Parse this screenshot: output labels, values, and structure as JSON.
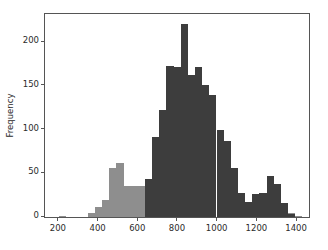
{
  "chart_data": {
    "type": "bar",
    "title": "",
    "xlabel": "",
    "ylabel": "Frequency",
    "xlim": [
      130,
      1460
    ],
    "ylim": [
      0,
      232
    ],
    "grid": false,
    "legend": null,
    "bin_width": 36,
    "xticks": [
      200,
      400,
      600,
      800,
      1000,
      1200,
      1400
    ],
    "xticklabels": [
      "200",
      "400",
      "600",
      "800",
      "1000",
      "1200",
      "1400"
    ],
    "yticks": [
      0,
      50,
      100,
      150,
      200
    ],
    "yticklabels": [
      "0",
      "50",
      "100",
      "150",
      "200"
    ],
    "series": [
      {
        "name": "light",
        "color": "#8e8e8e",
        "bin_starts": [
          202,
          238,
          274,
          310,
          346,
          382,
          418,
          454,
          490,
          526,
          562,
          598,
          634,
          670,
          706,
          742,
          778,
          814,
          850,
          886,
          922,
          958,
          994,
          1030,
          1066,
          1102,
          1138,
          1174,
          1210,
          1246,
          1282,
          1318,
          1354,
          1390
        ],
        "values": [
          1,
          0,
          0,
          0,
          5,
          11,
          19,
          56,
          62,
          35,
          35,
          35,
          22,
          47,
          49,
          57,
          66,
          80,
          65,
          54,
          39,
          34,
          26,
          15,
          11,
          7,
          10,
          11,
          14,
          22,
          21,
          10,
          5,
          1
        ]
      },
      {
        "name": "dark",
        "color": "#3d3d3d",
        "bin_starts": [
          202,
          238,
          274,
          310,
          346,
          382,
          418,
          454,
          490,
          526,
          562,
          598,
          634,
          670,
          706,
          742,
          778,
          814,
          850,
          886,
          922,
          958,
          994,
          1030,
          1066,
          1102,
          1138,
          1174,
          1210,
          1246,
          1282,
          1318,
          1354,
          1390
        ],
        "values": [
          0,
          0,
          0,
          0,
          0,
          0,
          0,
          0,
          0,
          0,
          0,
          0,
          43,
          92,
          122,
          173,
          172,
          221,
          162,
          171,
          151,
          140,
          99,
          87,
          56,
          27,
          17,
          26,
          27,
          47,
          38,
          16,
          3,
          0
        ]
      }
    ]
  }
}
